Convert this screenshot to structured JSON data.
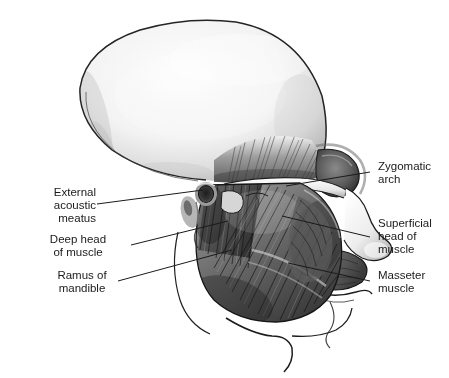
{
  "figure": {
    "type": "anatomical-illustration",
    "style": "grayscale pencil/airbrush medical illustration",
    "background_color": "#ffffff",
    "ink_color": "#1a1a1a",
    "bone_light": "#f2f2f2",
    "bone_mid": "#c9c9c9",
    "bone_shadow": "#8e8e8e",
    "muscle_mid": "#7e7e7e",
    "muscle_dark": "#3c3c3c"
  },
  "labels": {
    "left": [
      {
        "id": "external-acoustic-meatus",
        "text": "External\nacoustic\nmeatus"
      },
      {
        "id": "deep-head-of-muscle",
        "text": "Deep head\nof muscle"
      },
      {
        "id": "ramus-of-mandible",
        "text": "Ramus of\nmandible"
      }
    ],
    "right": [
      {
        "id": "zygomatic-arch",
        "text": "Zygomatic\narch"
      },
      {
        "id": "superficial-head-of-muscle",
        "text": "Superficial\nhead of\nmuscle"
      },
      {
        "id": "masseter-muscle",
        "text": "Masseter\nmuscle"
      }
    ]
  },
  "structures": [
    {
      "id": "cranium",
      "name": "cranial vault / calvaria"
    },
    {
      "id": "temporal-fossa",
      "name": "temporal fossa"
    },
    {
      "id": "orbit",
      "name": "orbit (eye socket)"
    },
    {
      "id": "nasal-bones",
      "name": "nasal region"
    },
    {
      "id": "zygomatic-arch",
      "name": "zygomatic arch"
    },
    {
      "id": "ear-canal",
      "name": "external acoustic meatus"
    },
    {
      "id": "masseter",
      "name": "masseter muscle (superficial and deep heads)"
    },
    {
      "id": "mandible",
      "name": "mandible / ramus"
    },
    {
      "id": "neck-contour",
      "name": "neck and throat soft-tissue contour"
    }
  ]
}
